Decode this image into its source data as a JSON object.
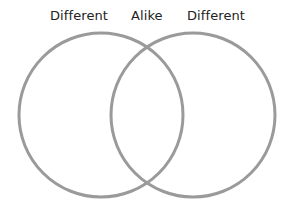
{
  "diagram": {
    "type": "venn",
    "labels": {
      "left": "Different",
      "middle": "Alike",
      "right": "Different"
    },
    "circles": [
      {
        "name": "left",
        "cx": 101,
        "cy": 115,
        "r": 82
      },
      {
        "name": "right",
        "cx": 193,
        "cy": 115,
        "r": 82
      }
    ],
    "stroke_color": "#999999"
  }
}
